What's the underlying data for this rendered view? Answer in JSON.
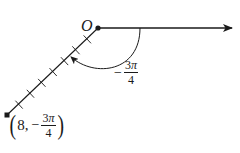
{
  "diagram": {
    "type": "polar-coordinate-plot",
    "origin": {
      "label": "O",
      "x": 98,
      "y": 28
    },
    "polar_axis": {
      "direction": "right",
      "end_x": 232
    },
    "angle": {
      "sign": "−",
      "numerator": "3π",
      "numerator_digit": "3",
      "numerator_symbol": "π",
      "denominator": "4",
      "radians": -2.356,
      "direction": "clockwise"
    },
    "point": {
      "r": "8",
      "theta_sign": "−",
      "theta_numerator_digit": "3",
      "theta_numerator_symbol": "π",
      "theta_denominator": "4",
      "separator": ",",
      "open_paren": "(",
      "close_paren": ")",
      "x": 7,
      "y": 115
    },
    "ticks": {
      "count": 7,
      "units": 8
    },
    "colors": {
      "ink": "#1a1a1a",
      "background": "#ffffff"
    }
  }
}
